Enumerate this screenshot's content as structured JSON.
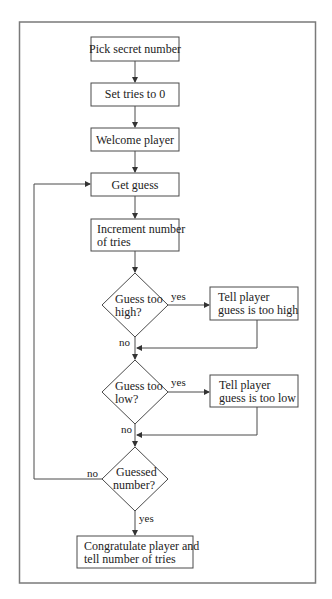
{
  "diagram": {
    "nodes": {
      "pick": {
        "type": "process",
        "lines": [
          "Pick secret number"
        ]
      },
      "set_tries": {
        "type": "process",
        "lines": [
          "Set tries to 0"
        ]
      },
      "welcome": {
        "type": "process",
        "lines": [
          "Welcome player"
        ]
      },
      "get_guess": {
        "type": "process",
        "lines": [
          "Get guess"
        ]
      },
      "increment": {
        "type": "process",
        "lines": [
          "Increment number",
          "of tries"
        ]
      },
      "too_high": {
        "type": "decision",
        "lines": [
          "Guess too",
          "high?"
        ]
      },
      "tell_high": {
        "type": "process",
        "lines": [
          "Tell player",
          "guess is too high"
        ]
      },
      "too_low": {
        "type": "decision",
        "lines": [
          "Guess too",
          "low?"
        ]
      },
      "tell_low": {
        "type": "process",
        "lines": [
          "Tell player",
          "guess is too low"
        ]
      },
      "guessed": {
        "type": "decision",
        "lines": [
          "Guessed",
          "number?"
        ]
      },
      "congratulate": {
        "type": "process",
        "lines": [
          "Congratulate player and",
          "tell number of tries"
        ]
      }
    },
    "edges": {
      "too_high_yes": "yes",
      "too_high_no": "no",
      "too_low_yes": "yes",
      "too_low_no": "no",
      "guessed_no": "no",
      "guessed_yes": "yes"
    },
    "colors": {
      "frame": "#7a7a7a",
      "stroke": "#4a4a4a",
      "text": "#222222",
      "background": "#ffffff"
    }
  }
}
